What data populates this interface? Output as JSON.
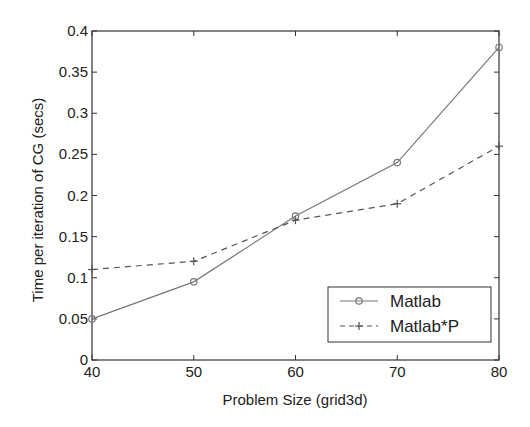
{
  "chart_data": {
    "type": "line",
    "title": "",
    "xlabel": "Problem Size (grid3d)",
    "ylabel": "Time per iteration of CG (secs)",
    "x": [
      40,
      50,
      60,
      70,
      80
    ],
    "xlim": [
      40,
      80
    ],
    "ylim": [
      0,
      0.4
    ],
    "xticks": [
      "40",
      "50",
      "60",
      "70",
      "80"
    ],
    "yticks": [
      "0",
      "0.05",
      "0.1",
      "0.15",
      "0.2",
      "0.25",
      "0.3",
      "0.35",
      "0.4"
    ],
    "grid": false,
    "legend_position": "lower right",
    "series": [
      {
        "name": "Matlab",
        "style": "solid",
        "marker": "circle",
        "color": "#777777",
        "values": [
          0.05,
          0.095,
          0.175,
          0.24,
          0.38
        ]
      },
      {
        "name": "Matlab*P",
        "style": "dashed",
        "marker": "plus",
        "color": "#555555",
        "values": [
          0.11,
          0.12,
          0.17,
          0.19,
          0.26
        ]
      }
    ]
  }
}
